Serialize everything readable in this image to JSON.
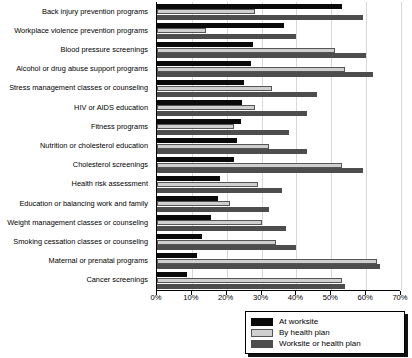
{
  "chart_data": {
    "type": "bar",
    "orientation": "horizontal",
    "title": "",
    "xlabel": "",
    "ylabel": "",
    "xlim": [
      0,
      70
    ],
    "xticks": [
      "0%",
      "10%",
      "20%",
      "30%",
      "40%",
      "50%",
      "60%",
      "70%"
    ],
    "xtick_values": [
      0,
      10,
      20,
      30,
      40,
      50,
      60,
      70
    ],
    "grid": true,
    "legend_position": "bottom-right",
    "categories": [
      "Back injury prevention programs",
      "Workplace violence prevention programs",
      "Blood pressure screenings",
      "Alcohol or drug abuse support programs",
      "Stress management classes or counseling",
      "HIV or AIDS education",
      "Fitness programs",
      "Nutrition or cholesterol education",
      "Cholesterol screenings",
      "Health risk assessment",
      "Education or balancing work and family",
      "Weight management classes or counseling",
      "Smoking cessation classes or counseling",
      "Maternal or prenatal programs",
      "Cancer screenings"
    ],
    "series": [
      {
        "name": "At worksite",
        "color": "#0a0a0a",
        "values": [
          53,
          36.5,
          27.5,
          27,
          25,
          24.5,
          24,
          23,
          22,
          18,
          17.5,
          15.5,
          13,
          11.5,
          8.5
        ]
      },
      {
        "name": "By health plan",
        "color": "#cfcfcf",
        "values": [
          28,
          14,
          51,
          54,
          33,
          28,
          22,
          32,
          53,
          29,
          21,
          30,
          34,
          63,
          53
        ]
      },
      {
        "name": "Worksite or health plan",
        "color": "#4d4d4d",
        "values": [
          59,
          40,
          60,
          62,
          46,
          43,
          38,
          43,
          59,
          36,
          32,
          37,
          40,
          64,
          54
        ]
      }
    ]
  },
  "legend": {
    "items": [
      {
        "label": "At worksite"
      },
      {
        "label": "By health plan"
      },
      {
        "label": "Worksite or health plan"
      }
    ]
  }
}
